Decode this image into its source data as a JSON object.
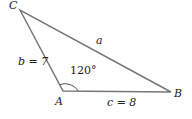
{
  "diagram": {
    "type": "triangle",
    "vertices": {
      "C": {
        "label": "C",
        "x": 20,
        "y": 10
      },
      "A": {
        "label": "A",
        "x": 63,
        "y": 91
      },
      "B": {
        "label": "B",
        "x": 171,
        "y": 92
      }
    },
    "sides": {
      "a": {
        "label": "a"
      },
      "b": {
        "label": "b = 7"
      },
      "c": {
        "label": "c = 8"
      }
    },
    "angle": {
      "vertex": "A",
      "label": "120°"
    },
    "colors": {
      "line": "#777777",
      "text": "#222222"
    }
  }
}
